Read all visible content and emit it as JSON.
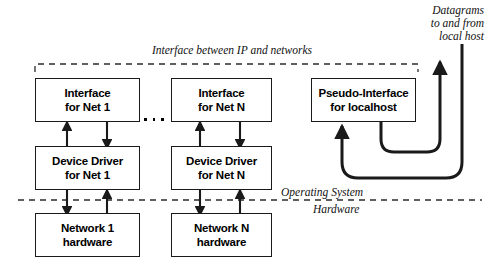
{
  "diagram": {
    "boxes": [
      {
        "id": "interface-net-1",
        "line1": "Interface",
        "line2": "for Net 1"
      },
      {
        "id": "interface-net-n",
        "line1": "Interface",
        "line2": "for Net N"
      },
      {
        "id": "pseudo-interface-localhost",
        "line1": "Pseudo-Interface",
        "line2": "for localhost"
      },
      {
        "id": "device-driver-net-1",
        "line1": "Device Driver",
        "line2": "for Net 1"
      },
      {
        "id": "device-driver-net-n",
        "line1": "Device Driver",
        "line2": "for Net N"
      },
      {
        "id": "network-1-hardware",
        "line1": "Network 1",
        "line2": "hardware"
      },
      {
        "id": "network-n-hardware",
        "line1": "Network N",
        "line2": "hardware"
      }
    ],
    "annotations": {
      "datagrams": {
        "line1": "Datagrams",
        "line2": "to and from",
        "line3": "local host"
      },
      "ip_interface": "Interface between IP and networks",
      "operating_system": "Operating System",
      "hardware": "Hardware"
    },
    "ellipsis": "• • •",
    "colors": {
      "stroke": "#1a1a1a",
      "background": "#ffffff",
      "text": "#000000",
      "dashed": "#2b2b2b"
    }
  }
}
